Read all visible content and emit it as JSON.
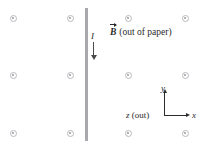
{
  "figure": {
    "background_color": "#ffffff",
    "width": 202,
    "height": 144
  },
  "wire": {
    "name": "vertical current-carrying wire",
    "color": "#a9a9ad",
    "x": 85,
    "width": 3,
    "y_top": 8,
    "y_bottom": 141
  },
  "current": {
    "label": "I",
    "direction": "down",
    "arrow_color": "#4a4a4a",
    "label_x": 91,
    "label_y": 32,
    "shaft_x": 93,
    "shaft_top": 42,
    "shaft_bottom": 56,
    "head_y": 55
  },
  "field": {
    "symbol": "B",
    "description": "(out of paper)",
    "marker_icon": "circle-dot-out-of-page",
    "marker_color": "#b9b9bd",
    "label_x": 110,
    "label_y": 28,
    "markers": [
      {
        "x": 13,
        "y": 18
      },
      {
        "x": 70,
        "y": 18
      },
      {
        "x": 128,
        "y": 18
      },
      {
        "x": 185,
        "y": 18
      },
      {
        "x": 13,
        "y": 75
      },
      {
        "x": 70,
        "y": 75
      },
      {
        "x": 128,
        "y": 75
      },
      {
        "x": 185,
        "y": 75
      },
      {
        "x": 13,
        "y": 133
      },
      {
        "x": 70,
        "y": 133
      },
      {
        "x": 128,
        "y": 133
      },
      {
        "x": 185,
        "y": 133
      }
    ]
  },
  "axes": {
    "origin_x": 164,
    "origin_y": 115,
    "color": "#2b2b2b",
    "y_axis": {
      "label": "y",
      "top": 93,
      "label_x": 161,
      "label_y": 84
    },
    "x_axis": {
      "label": "x",
      "right": 186,
      "label_x": 192,
      "label_y": 111
    },
    "z_axis": {
      "label_italic": "z",
      "label_rest": " (out)",
      "label_x": 126,
      "label_y": 111
    }
  }
}
